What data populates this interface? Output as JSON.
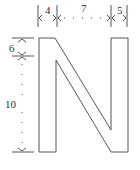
{
  "diagram": {
    "letter": "N",
    "stroke_color": "#555555",
    "dimensions": {
      "top": [
        {
          "label": "4"
        },
        {
          "label": "7"
        },
        {
          "label": "5"
        }
      ],
      "left": [
        {
          "label": "6"
        },
        {
          "label": "10"
        }
      ]
    }
  }
}
